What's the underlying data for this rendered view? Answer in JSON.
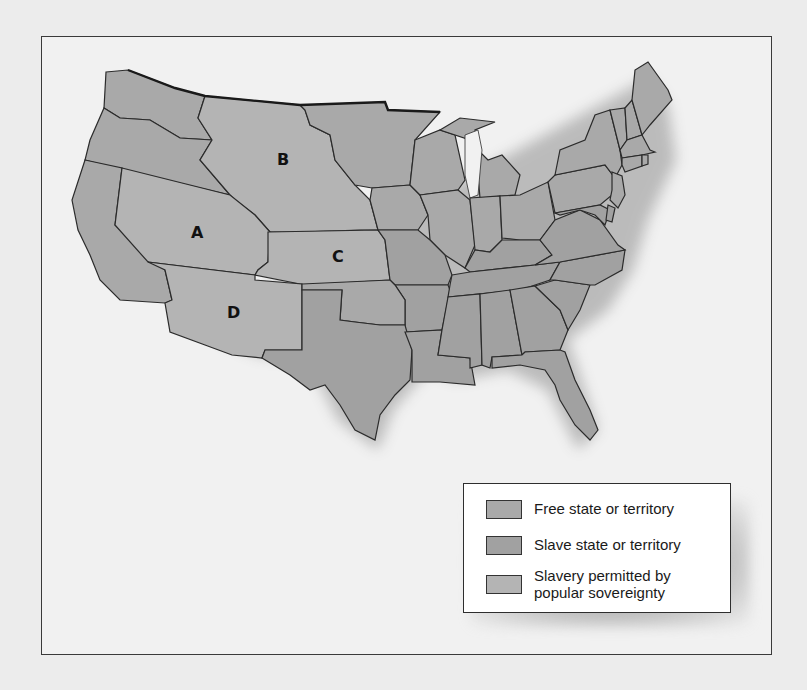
{
  "map": {
    "title": "",
    "colors": {
      "free": "#a9a9a9",
      "slave": "#a1a1a1",
      "popular_sovereignty": "#b4b4b4",
      "border": "#2b2b2b",
      "water": "#f1f1f1"
    },
    "region_labels": [
      {
        "id": "A",
        "label": "A",
        "x": 197,
        "y": 238
      },
      {
        "id": "B",
        "label": "B",
        "x": 283,
        "y": 165
      },
      {
        "id": "C",
        "label": "C",
        "x": 338,
        "y": 262
      },
      {
        "id": "D",
        "label": "D",
        "x": 233,
        "y": 318
      }
    ]
  },
  "legend": {
    "items": [
      {
        "key": "free",
        "label_lines": [
          "Free state or territory"
        ]
      },
      {
        "key": "slave",
        "label_lines": [
          "Slave state or territory"
        ]
      },
      {
        "key": "popular_sovereignty",
        "label_lines": [
          "Slavery permitted by",
          "popular sovereignty"
        ]
      }
    ]
  }
}
